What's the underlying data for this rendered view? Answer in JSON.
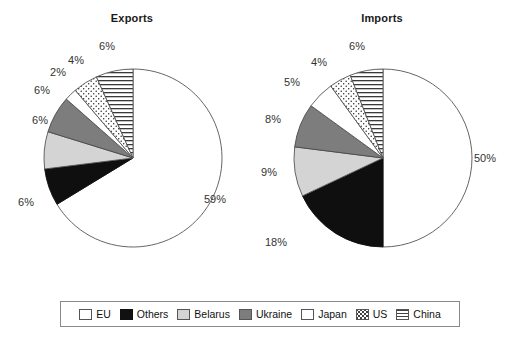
{
  "chart_data": [
    {
      "type": "pie",
      "title": "Exports",
      "categories": [
        "EU",
        "Others",
        "Belarus",
        "Ukraine",
        "Japan",
        "US",
        "China"
      ],
      "values": [
        59,
        6,
        6,
        6,
        2,
        4,
        6
      ],
      "labels": [
        "59%",
        "6%",
        "6%",
        "6%",
        "2%",
        "4%",
        "6%"
      ],
      "unit": "%",
      "start_angle_deg": 0,
      "direction": "clockwise",
      "legend_position": "bottom"
    },
    {
      "type": "pie",
      "title": "Imports",
      "categories": [
        "EU",
        "Others",
        "Belarus",
        "Ukraine",
        "Japan",
        "US",
        "China"
      ],
      "values": [
        50,
        18,
        9,
        8,
        5,
        4,
        6
      ],
      "labels": [
        "50%",
        "18%",
        "9%",
        "8%",
        "5%",
        "4%",
        "6%"
      ],
      "unit": "%",
      "start_angle_deg": 0,
      "direction": "clockwise",
      "legend_position": "bottom"
    }
  ],
  "titles": {
    "exports": "Exports",
    "imports": "Imports"
  },
  "exports_labels": {
    "eu": "59%",
    "others": "6%",
    "belarus": "6%",
    "ukraine": "6%",
    "japan": "2%",
    "us": "4%",
    "china": "6%"
  },
  "imports_labels": {
    "eu": "50%",
    "others": "18%",
    "belarus": "9%",
    "ukraine": "8%",
    "japan": "5%",
    "us": "4%",
    "china": "6%"
  },
  "legend": {
    "items": [
      {
        "label": "EU",
        "swatch": "white-swatch",
        "color": "#ffffff"
      },
      {
        "label": "Others",
        "swatch": "black-swatch",
        "color": "#111111"
      },
      {
        "label": "Belarus",
        "swatch": "light-gray-swatch",
        "color": "#d4d4d4"
      },
      {
        "label": "Ukraine",
        "swatch": "dark-gray-swatch",
        "color": "#7d7d7d"
      },
      {
        "label": "Japan",
        "swatch": "white-swatch",
        "color": "#ffffff"
      },
      {
        "label": "US",
        "swatch": "dotted-swatch",
        "color": "#ffffff"
      },
      {
        "label": "China",
        "swatch": "horizontal-line-swatch",
        "color": "#ffffff"
      }
    ]
  }
}
